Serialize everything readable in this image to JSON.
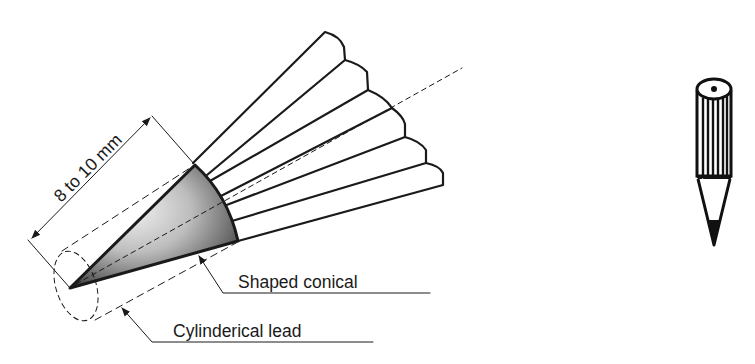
{
  "diagram": {
    "dimension": {
      "label": "8 to 10 mm"
    },
    "callouts": [
      {
        "id": "shaped-conical",
        "label": "Shaped conical"
      },
      {
        "id": "cylindrical-lead",
        "label": "Cylinderical lead"
      }
    ],
    "icons": {
      "main": "sharpened-pencil-detail-icon",
      "side": "pencil-icon"
    },
    "colors": {
      "line": "#1a1a1a",
      "background": "#ffffff",
      "cone_light": "#f2f2f2",
      "cone_dark": "#3a3a3a"
    }
  }
}
